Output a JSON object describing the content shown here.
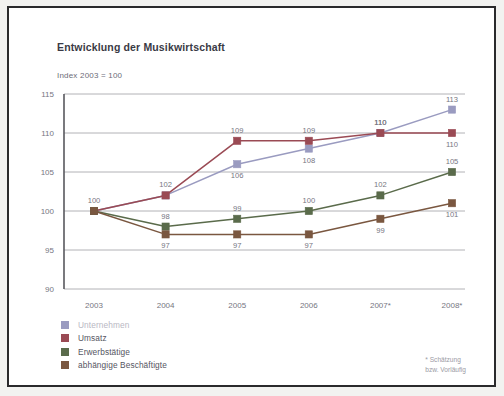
{
  "chart_data": {
    "type": "line",
    "title": "Entwicklung der Musikwirtschaft",
    "subtitle": "Index 2003 = 100",
    "xlabel": "",
    "ylabel": "",
    "categories": [
      "2003",
      "2004",
      "2005",
      "2006",
      "2007*",
      "2008*"
    ],
    "ylim": [
      90,
      115
    ],
    "yticks": [
      90,
      95,
      100,
      105,
      110,
      115
    ],
    "grid": true,
    "legend_position": "bottom-left",
    "footnote": "* Schätzung\nbzw. Vorläufig",
    "series": [
      {
        "name": "Unternehmen",
        "color": "#9a9bc0",
        "values": [
          100,
          102,
          106,
          108,
          110,
          113
        ],
        "labels": [
          "",
          "",
          "106",
          "108",
          "110",
          "113"
        ],
        "label_pos": [
          "below",
          "below",
          "below",
          "below",
          "above",
          "above"
        ]
      },
      {
        "name": "Umsatz",
        "color": "#9a4a54",
        "values": [
          100,
          102,
          109,
          109,
          110,
          110
        ],
        "labels": [
          "100",
          "102",
          "109",
          "109",
          "110",
          "110"
        ],
        "label_pos": [
          "above",
          "above",
          "above",
          "above",
          "above",
          "below"
        ]
      },
      {
        "name": "Erwerbstätige",
        "color": "#5a6b4b",
        "values": [
          100,
          98,
          99,
          100,
          102,
          105
        ],
        "labels": [
          "",
          "98",
          "99",
          "100",
          "102",
          "105"
        ],
        "label_pos": [
          "above",
          "above",
          "above",
          "above",
          "above",
          "above"
        ]
      },
      {
        "name": "abhängige Beschäftigte",
        "color": "#7a5740",
        "values": [
          100,
          97,
          97,
          97,
          99,
          101
        ],
        "labels": [
          "",
          "97",
          "97",
          "97",
          "99",
          "101"
        ],
        "label_pos": [
          "above",
          "below",
          "below",
          "below",
          "below",
          "below"
        ]
      }
    ]
  },
  "legend": {
    "items": [
      {
        "label": "Unternehmen",
        "color": "#9a9bc0"
      },
      {
        "label": "Umsatz",
        "color": "#9a4a54"
      },
      {
        "label": "Erwerbstätige",
        "color": "#5a6b4b"
      },
      {
        "label": "abhängige Beschäftigte",
        "color": "#7a5740"
      }
    ]
  },
  "footnote": {
    "line1": "* Schätzung",
    "line2": "bzw. Vorläufig"
  },
  "axes": {
    "y_ticks": [
      "115",
      "110",
      "105",
      "100",
      "95",
      "90"
    ],
    "x_ticks": [
      "2003",
      "2004",
      "2005",
      "2006",
      "2007*",
      "2008*"
    ]
  }
}
